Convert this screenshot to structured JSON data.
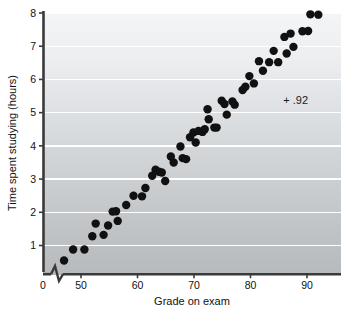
{
  "chart_data": {
    "type": "scatter",
    "title": "",
    "xlabel": "Grade on exam",
    "ylabel": "Time spent studying (hours)",
    "xlim": [
      44,
      94
    ],
    "ylim": [
      0.2,
      8.3
    ],
    "xticks": [
      0,
      50,
      60,
      70,
      80,
      90
    ],
    "xticklabels": [
      "0",
      "50",
      "60",
      "70",
      "80",
      "90"
    ],
    "yticks": [
      1,
      2,
      3,
      4,
      5,
      6,
      7,
      8
    ],
    "yticklabels": [
      "1",
      "2",
      "3",
      "4",
      "5",
      "6",
      "7",
      "8"
    ],
    "grid": true,
    "grid_axis": "y",
    "grid_color": "#ffffff",
    "axis_break_x": true,
    "legend": "none",
    "marker_color": "#111111",
    "marker_size": 4.2,
    "plot_bg_top": "#f2f3f5",
    "plot_bg_bottom": "#b9bcbf",
    "annotations": [
      {
        "text": "+ .92",
        "x": 88.0,
        "y": 5.25
      }
    ],
    "series": [
      {
        "name": "students",
        "points": [
          [
            47.0,
            0.55
          ],
          [
            48.6,
            0.88
          ],
          [
            50.6,
            0.88
          ],
          [
            52.0,
            1.28
          ],
          [
            52.6,
            1.66
          ],
          [
            54.0,
            1.32
          ],
          [
            54.8,
            1.6
          ],
          [
            55.6,
            2.02
          ],
          [
            56.2,
            2.03
          ],
          [
            56.5,
            1.74
          ],
          [
            58.0,
            2.22
          ],
          [
            59.3,
            2.5
          ],
          [
            60.8,
            2.48
          ],
          [
            61.4,
            2.73
          ],
          [
            62.6,
            3.1
          ],
          [
            63.2,
            3.28
          ],
          [
            63.8,
            3.22
          ],
          [
            64.3,
            3.2
          ],
          [
            64.9,
            2.94
          ],
          [
            65.9,
            3.68
          ],
          [
            66.4,
            3.5
          ],
          [
            67.6,
            3.98
          ],
          [
            68.0,
            3.63
          ],
          [
            68.6,
            3.6
          ],
          [
            69.3,
            4.26
          ],
          [
            69.9,
            4.4
          ],
          [
            70.3,
            4.1
          ],
          [
            70.8,
            4.45
          ],
          [
            71.5,
            4.42
          ],
          [
            71.9,
            4.5
          ],
          [
            72.4,
            5.1
          ],
          [
            72.6,
            4.8
          ],
          [
            73.6,
            4.55
          ],
          [
            74.0,
            4.55
          ],
          [
            74.9,
            5.36
          ],
          [
            75.4,
            5.26
          ],
          [
            75.8,
            4.94
          ],
          [
            76.8,
            5.34
          ],
          [
            77.2,
            5.24
          ],
          [
            78.6,
            5.68
          ],
          [
            79.1,
            5.78
          ],
          [
            79.8,
            6.1
          ],
          [
            80.6,
            5.88
          ],
          [
            81.5,
            6.55
          ],
          [
            82.2,
            6.26
          ],
          [
            83.3,
            6.52
          ],
          [
            84.1,
            6.86
          ],
          [
            84.9,
            6.52
          ],
          [
            86.0,
            7.28
          ],
          [
            86.4,
            6.78
          ],
          [
            87.1,
            7.38
          ],
          [
            87.6,
            6.98
          ],
          [
            89.2,
            7.45
          ],
          [
            90.2,
            7.46
          ],
          [
            90.6,
            7.96
          ],
          [
            92.0,
            7.95
          ]
        ]
      }
    ]
  }
}
